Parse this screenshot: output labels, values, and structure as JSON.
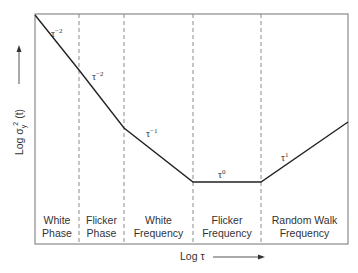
{
  "diagram": {
    "type": "allan-variance-loglog",
    "y_axis": {
      "label_prefix": "Log σ",
      "label_sub": "y",
      "label_sup": "2",
      "label_suffix": " (t)",
      "arrow": "up"
    },
    "x_axis": {
      "label": "Log τ",
      "arrow": "right"
    },
    "regions": [
      {
        "line1": "White",
        "line2": "Phase"
      },
      {
        "line1": "Flicker",
        "line2": "Phase"
      },
      {
        "line1": "White",
        "line2": "Frequency"
      },
      {
        "line1": "Flicker",
        "line2": "Frequency"
      },
      {
        "line1": "Random Walk",
        "line2": "Frequency"
      }
    ],
    "slope_labels": [
      {
        "base": "τ",
        "exp": "−2"
      },
      {
        "base": "τ",
        "exp": "−2"
      },
      {
        "base": "τ",
        "exp": "−1"
      },
      {
        "base": "τ",
        "exp": "0"
      },
      {
        "base": "τ",
        "exp": "1"
      }
    ],
    "colors": {
      "curve": "#222222",
      "frame": "#888888",
      "dividers": "#888888"
    }
  }
}
